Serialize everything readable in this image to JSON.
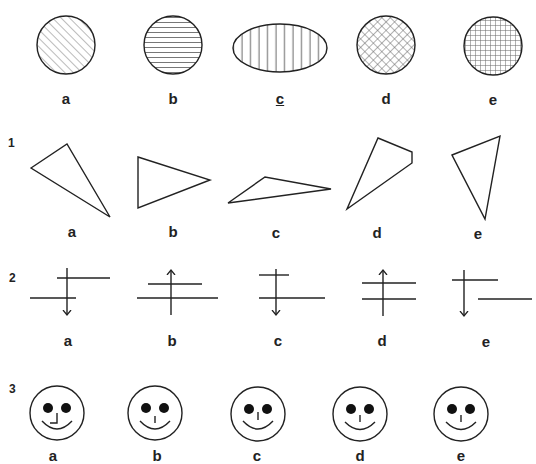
{
  "rows": [
    {
      "row_number": "",
      "description": "Example row: shaded shapes",
      "options": [
        {
          "label": "a",
          "shape": "circle",
          "hatch": "diagonal",
          "underlined": false
        },
        {
          "label": "b",
          "shape": "circle",
          "hatch": "horizontal",
          "underlined": false
        },
        {
          "label": "c",
          "shape": "ellipse",
          "hatch": "vertical",
          "underlined": true
        },
        {
          "label": "d",
          "shape": "circle",
          "hatch": "diagonal-crosshatch",
          "underlined": false
        },
        {
          "label": "e",
          "shape": "circle",
          "hatch": "grid-crosshatch",
          "underlined": false
        }
      ]
    },
    {
      "row_number": "1",
      "description": "Triangles / quadrilateral outlines",
      "options": [
        {
          "label": "a",
          "shape": "triangle"
        },
        {
          "label": "b",
          "shape": "triangle"
        },
        {
          "label": "c",
          "shape": "triangle"
        },
        {
          "label": "d",
          "shape": "quadrilateral"
        },
        {
          "label": "e",
          "shape": "triangle"
        }
      ]
    },
    {
      "row_number": "2",
      "description": "Lines with arrows",
      "options": [
        {
          "label": "a",
          "arrow": "down"
        },
        {
          "label": "b",
          "arrow": "up"
        },
        {
          "label": "c",
          "arrow": "down"
        },
        {
          "label": "d",
          "arrow": "up"
        },
        {
          "label": "e",
          "arrow": "down"
        }
      ]
    },
    {
      "row_number": "3",
      "description": "Smiley faces",
      "options": [
        {
          "label": "a",
          "nose": "L-shaped"
        },
        {
          "label": "b",
          "nose": "line"
        },
        {
          "label": "c",
          "nose": "line"
        },
        {
          "label": "d",
          "nose": "line"
        },
        {
          "label": "e",
          "nose": "line"
        }
      ]
    }
  ],
  "colors": {
    "stroke": "#222222",
    "hatch": "#555555",
    "background": "#ffffff"
  }
}
